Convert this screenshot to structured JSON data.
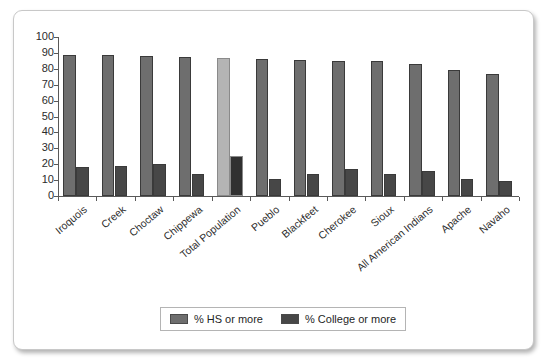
{
  "chart_data": {
    "type": "bar",
    "title": "",
    "xlabel": "",
    "ylabel": "",
    "ylim": [
      0,
      100
    ],
    "ytick_step": 10,
    "yticks": [
      "100",
      "90",
      "80",
      "70",
      "60",
      "50",
      "40",
      "30",
      "20",
      "10",
      "0"
    ],
    "grid": false,
    "legend_position": "bottom-center",
    "categories": [
      "Iroquois",
      "Creek",
      "Choctaw",
      "Chippewa",
      "Total Population",
      "Pueblo",
      "Blackfeet",
      "Cherokee",
      "Sioux",
      "All American Indians",
      "Apache",
      "Navaho"
    ],
    "series": [
      {
        "name": "% HS or more",
        "color": "#6e6e6e",
        "highlight_color": "#b4b4b4",
        "highlight_category": "Total Population",
        "values": [
          89,
          88.5,
          88,
          87.5,
          86.5,
          86,
          85.5,
          85,
          85,
          83,
          79.5,
          77
        ]
      },
      {
        "name": "% College or more",
        "color": "#474747",
        "highlight_color": "#303030",
        "highlight_category": "Total Population",
        "values": [
          18,
          19,
          20,
          14,
          25,
          11,
          14,
          17,
          14,
          16,
          11,
          9.5
        ]
      }
    ]
  },
  "legend": {
    "entries": [
      {
        "label": "% HS or more",
        "color": "#6e6e6e"
      },
      {
        "label": "% College or more",
        "color": "#474747"
      }
    ]
  },
  "colors": {
    "frame_border": "#c8c8c8",
    "axis": "#595959",
    "text": "#2b2b2b",
    "background": "#ffffff"
  }
}
